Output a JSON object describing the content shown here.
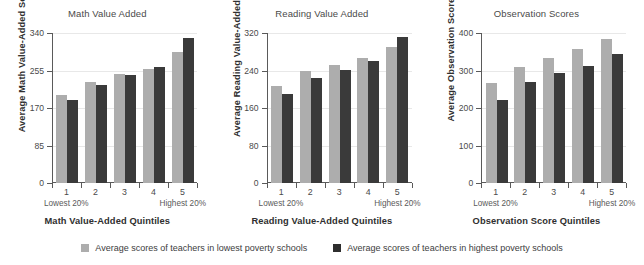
{
  "chart_data": [
    {
      "type": "bar",
      "title": "Math Value Added",
      "xlabel": "Math Value-Added Quintiles",
      "ylabel": "Average Math Value-Added Score",
      "categories": [
        "1",
        "2",
        "3",
        "4",
        "5"
      ],
      "xtick_end_labels": {
        "left": "Lowest 20%",
        "right": "Highest 20%"
      },
      "yticks": [
        0,
        85,
        170,
        255,
        340
      ],
      "ylim": [
        0,
        340
      ],
      "grid": true,
      "legend_position": "bottom",
      "series": [
        {
          "name": "Average scores of teachers in lowest poverty schools",
          "color": "#adadad",
          "values": [
            200,
            228,
            246,
            258,
            298
          ]
        },
        {
          "name": "Average scores of teachers in highest poverty schools",
          "color": "#3a3a3a",
          "values": [
            188,
            222,
            245,
            263,
            328
          ]
        }
      ]
    },
    {
      "type": "bar",
      "title": "Reading Value Added",
      "xlabel": "Reading Value-Added Quintiles",
      "ylabel": "Average Reading Value-Added Score",
      "categories": [
        "1",
        "2",
        "3",
        "4",
        "5"
      ],
      "xtick_end_labels": {
        "left": "Lowest 20%",
        "right": "Highest 20%"
      },
      "yticks": [
        0,
        80,
        160,
        240,
        320
      ],
      "ylim": [
        0,
        320
      ],
      "grid": true,
      "legend_position": "bottom",
      "series": [
        {
          "name": "Average scores of teachers in lowest poverty schools",
          "color": "#adadad",
          "values": [
            207,
            238,
            252,
            266,
            290
          ]
        },
        {
          "name": "Average scores of teachers in highest poverty schools",
          "color": "#3a3a3a",
          "values": [
            190,
            223,
            242,
            260,
            312
          ]
        }
      ]
    },
    {
      "type": "bar",
      "title": "Observation Scores",
      "xlabel": "Observation Score Quintiles",
      "ylabel": "Average Observation Scores",
      "categories": [
        "1",
        "2",
        "3",
        "4",
        "5"
      ],
      "xtick_end_labels": {
        "left": "Lowest 20%",
        "right": "Highest 20%"
      },
      "yticks": [
        0,
        100,
        200,
        300,
        400
      ],
      "ylim": [
        0,
        400
      ],
      "grid": true,
      "legend_position": "bottom",
      "series": [
        {
          "name": "Average scores of teachers in lowest poverty schools",
          "color": "#adadad",
          "values": [
            268,
            310,
            333,
            357,
            383
          ]
        },
        {
          "name": "Average scores of teachers in highest poverty schools",
          "color": "#3a3a3a",
          "values": [
            221,
            270,
            293,
            312,
            345
          ]
        }
      ]
    }
  ],
  "legend": {
    "items": [
      {
        "label": "Average scores of teachers in lowest poverty schools",
        "color": "#adadad"
      },
      {
        "label": "Average scores of teachers in highest poverty schools",
        "color": "#2e2e2e"
      }
    ]
  }
}
